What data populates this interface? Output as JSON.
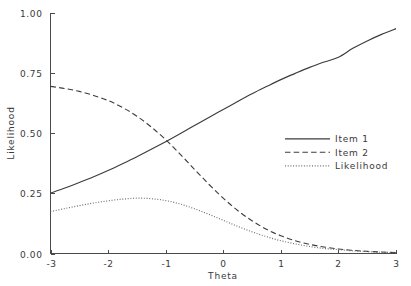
{
  "chart_data": {
    "type": "line",
    "title": "",
    "xlabel": "Theta",
    "ylabel": "Likelihood",
    "xlim": [
      -3,
      3
    ],
    "ylim": [
      0.0,
      1.0
    ],
    "grid": false,
    "legend_position": "center-right",
    "x_ticks": [
      -3,
      -2,
      -1,
      0,
      1,
      2,
      3
    ],
    "x_tick_labels": [
      "-3",
      "-2",
      "-1",
      "0",
      "1",
      "2",
      "3"
    ],
    "y_ticks": [
      0.0,
      0.25,
      0.5,
      0.75,
      1.0
    ],
    "y_tick_labels": [
      "0.00",
      "0.25",
      "0.50",
      "0.75",
      "1.00"
    ],
    "x": [
      -3.0,
      -2.75,
      -2.5,
      -2.25,
      -2.0,
      -1.75,
      -1.5,
      -1.25,
      -1.0,
      -0.75,
      -0.5,
      -0.25,
      0.0,
      0.25,
      0.5,
      0.75,
      1.0,
      1.25,
      1.5,
      1.75,
      2.0,
      2.25,
      2.5,
      2.75,
      3.0
    ],
    "series": [
      {
        "name": "Item 1",
        "style": "solid",
        "color": "#3c3c3c",
        "values": [
          0.251,
          0.272,
          0.295,
          0.319,
          0.345,
          0.373,
          0.402,
          0.433,
          0.465,
          0.498,
          0.532,
          0.566,
          0.599,
          0.632,
          0.664,
          0.694,
          0.723,
          0.749,
          0.774,
          0.796,
          0.816,
          0.853,
          0.884,
          0.911,
          0.935
        ]
      },
      {
        "name": "Item 2",
        "style": "dashed",
        "color": "#3c3c3c",
        "values": [
          0.695,
          0.686,
          0.674,
          0.657,
          0.636,
          0.607,
          0.571,
          0.526,
          0.473,
          0.413,
          0.35,
          0.288,
          0.23,
          0.179,
          0.136,
          0.101,
          0.074,
          0.053,
          0.038,
          0.027,
          0.019,
          0.013,
          0.009,
          0.006,
          0.004
        ]
      },
      {
        "name": "Likelihood",
        "style": "dotted",
        "color": "#6e6e6e",
        "values": [
          0.174,
          0.187,
          0.199,
          0.21,
          0.219,
          0.226,
          0.23,
          0.228,
          0.22,
          0.206,
          0.186,
          0.163,
          0.138,
          0.113,
          0.09,
          0.07,
          0.053,
          0.04,
          0.029,
          0.021,
          0.016,
          0.011,
          0.008,
          0.005,
          0.004
        ]
      }
    ],
    "legend_entries": [
      {
        "label": "Item 1",
        "style": "solid"
      },
      {
        "label": "Item 2",
        "style": "dashed"
      },
      {
        "label": "Likelihood",
        "style": "dotted"
      }
    ]
  }
}
